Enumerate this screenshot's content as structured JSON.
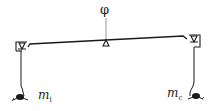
{
  "diagram": {
    "type": "balance-beam-schematic",
    "labels": {
      "angle_symbol": "φ",
      "left_mass": {
        "base": "m",
        "sub": "l"
      },
      "right_mass": {
        "base": "m",
        "sub": "c"
      }
    },
    "colors": {
      "stroke": "#1a1a1a",
      "pivot_line": "#999999",
      "background": "#ffffff"
    }
  }
}
